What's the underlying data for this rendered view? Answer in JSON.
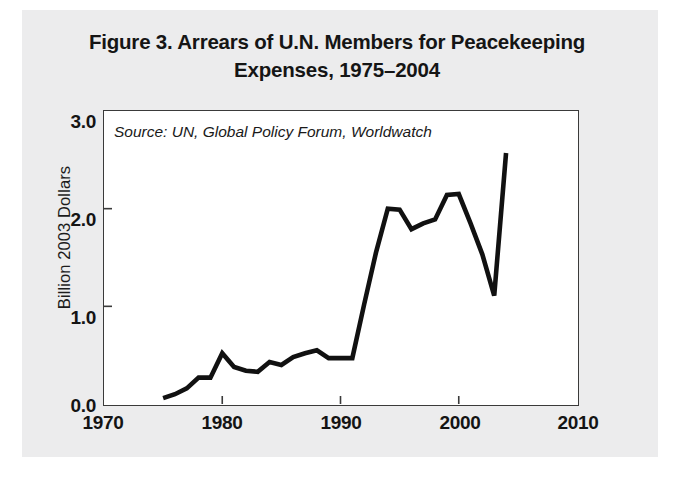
{
  "figure": {
    "title_line1": "Figure 3. Arrears of U.N. Members for Peacekeeping",
    "title_line2": "Expenses, 1975–2004",
    "source_note": "Source: UN, Global Policy Forum, Worldwatch"
  },
  "colors": {
    "page_background": "#ececed",
    "plot_background": "#ffffff",
    "line": "#111111",
    "frame": "#3a3a3a",
    "text": "#141414"
  },
  "chart_data": {
    "type": "line",
    "title": "Figure 3. Arrears of U.N. Members for Peacekeeping Expenses, 1975–2004",
    "xlabel": "",
    "ylabel": "Billion 2003 Dollars",
    "xlim": [
      1970,
      2010
    ],
    "ylim": [
      0.0,
      3.0
    ],
    "xticks": [
      1970,
      1980,
      1990,
      2000,
      2010
    ],
    "xticklabels": [
      "1970",
      "1980",
      "1990",
      "2000",
      "2010"
    ],
    "yticks": [
      0.0,
      1.0,
      2.0,
      3.0
    ],
    "yticklabels": [
      "0.0",
      "1.0",
      "2.0",
      "3.0"
    ],
    "grid": false,
    "legend": false,
    "annotations": [
      "Source: UN, Global Policy Forum, Worldwatch"
    ],
    "x": [
      1975,
      1976,
      1977,
      1978,
      1979,
      1980,
      1981,
      1982,
      1983,
      1984,
      1985,
      1986,
      1987,
      1988,
      1989,
      1990,
      1991,
      1992,
      1993,
      1994,
      1995,
      1996,
      1997,
      1998,
      1999,
      2000,
      2001,
      2002,
      2003,
      2004
    ],
    "series": [
      {
        "name": "Arrears of U.N. Members for Peacekeeping",
        "values": [
          0.06,
          0.1,
          0.16,
          0.27,
          0.27,
          0.52,
          0.38,
          0.34,
          0.33,
          0.43,
          0.4,
          0.48,
          0.52,
          0.55,
          0.47,
          0.47,
          0.47,
          1.02,
          1.55,
          2.0,
          1.99,
          1.79,
          1.85,
          1.89,
          2.14,
          2.15,
          1.85,
          1.53,
          1.11,
          2.57
        ]
      }
    ]
  },
  "axis": {
    "y_title": "Billion 2003 Dollars"
  }
}
